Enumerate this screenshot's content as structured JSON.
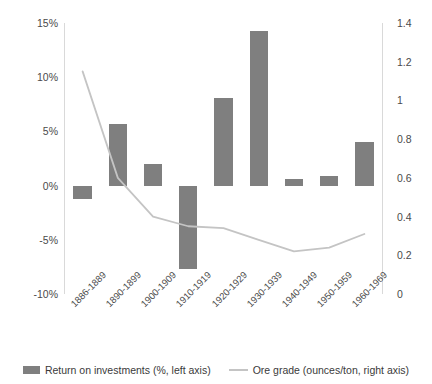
{
  "chart_data": {
    "type": "bar",
    "title": "",
    "subtitle": "",
    "xlabel": "",
    "ylabel": "",
    "grid": false,
    "legend_position": "bottom",
    "categories": [
      "1886-1889",
      "1890-1899",
      "1900-1909",
      "1910-1919",
      "1920-1929",
      "1930-1939",
      "1940-1949",
      "1950-1959",
      "1960-1969"
    ],
    "left_axis": {
      "label": "Return on investments (%, left axis)",
      "ticks": [
        "15%",
        "10%",
        "5%",
        "0%",
        "-5%",
        "-10%"
      ],
      "tick_values": [
        15,
        10,
        5,
        0,
        -5,
        -10
      ],
      "ylim": [
        -10,
        15
      ],
      "unit": "%"
    },
    "right_axis": {
      "label": "Ore grade (ounces/ton, right axis)",
      "ticks": [
        "1.4",
        "1.2",
        "1",
        "0.8",
        "0.6",
        "0.4",
        "0.2",
        "0"
      ],
      "tick_values": [
        1.4,
        1.2,
        1.0,
        0.8,
        0.6,
        0.4,
        0.2,
        0
      ],
      "ylim": [
        0,
        1.4
      ],
      "unit": "ounces/ton"
    },
    "series": [
      {
        "name": "Return on investments (%, left axis)",
        "type": "bar",
        "axis": "left",
        "color": "#7f7f7f",
        "values": [
          -1.2,
          5.7,
          2.0,
          -7.7,
          8.1,
          14.3,
          0.6,
          0.9,
          4.0
        ]
      },
      {
        "name": "Ore grade (ounces/ton, right axis)",
        "type": "line",
        "axis": "right",
        "color": "#c4c4c4",
        "values": [
          1.15,
          0.6,
          0.4,
          0.35,
          0.34,
          0.28,
          0.22,
          0.24,
          0.31
        ]
      }
    ]
  },
  "legend": {
    "items": [
      {
        "label": "Return on investments (%, left axis)",
        "marker": "bar-swatch",
        "color": "#7f7f7f"
      },
      {
        "label": "Ore grade (ounces/ton, right axis)",
        "marker": "line-swatch",
        "color": "#c4c4c4"
      }
    ]
  }
}
